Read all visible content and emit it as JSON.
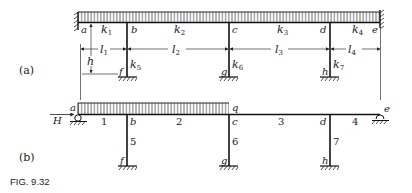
{
  "figure": {
    "caption": "FIG. 9.32",
    "panels": [
      {
        "label": "(a)",
        "joints": [
          "a",
          "b",
          "c",
          "d",
          "e",
          "f",
          "g",
          "h"
        ],
        "member_stiffness": [
          "k",
          "1",
          "k",
          "2",
          "k",
          "3",
          "k",
          "4",
          "k",
          "5",
          "k",
          "6",
          "k",
          "7"
        ],
        "spans": [
          "l",
          "1",
          "l",
          "2",
          "l",
          "3",
          "l",
          "4"
        ],
        "height_label": "h",
        "load": "uniformly distributed over full beam a–e",
        "supports": {
          "a": "fixed wall",
          "e": "fixed wall",
          "f": "fixed base",
          "g": "fixed base",
          "h": "fixed base"
        }
      },
      {
        "label": "(b)",
        "joints": [
          "a",
          "b",
          "c",
          "d",
          "e",
          "f",
          "g",
          "h"
        ],
        "member_numbers": [
          "1",
          "2",
          "3",
          "4",
          "5",
          "6",
          "7"
        ],
        "load_label": "q",
        "reaction_label": "H",
        "load": "uniformly distributed over a–c",
        "supports": {
          "a": "roller",
          "e": "pin",
          "f": "fixed base",
          "g": "fixed base",
          "h": "fixed base"
        }
      }
    ]
  },
  "labels": {
    "a_panel": "(a)",
    "b_panel": "(b)",
    "caption": "FIG. 9.32",
    "a": "a",
    "b": "b",
    "c": "c",
    "d": "d",
    "e": "e",
    "f": "f",
    "g": "g",
    "h": "h",
    "k": "k",
    "l": "l",
    "s1": "1",
    "s2": "2",
    "s3": "3",
    "s4": "4",
    "s5": "5",
    "s6": "6",
    "s7": "7",
    "hdim": "h",
    "q": "q",
    "H": "H",
    "m1": "1",
    "m2": "2",
    "m3": "3",
    "m4": "4",
    "m5": "5",
    "m6": "6",
    "m7": "7"
  }
}
